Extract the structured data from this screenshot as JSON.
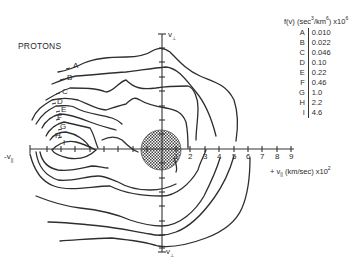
{
  "figure": {
    "title": "PROTONS",
    "legend": {
      "title_prefix": "f(v) (sec",
      "title_exp1": "3",
      "title_mid": "/km",
      "title_exp2": "6",
      "title_suffix": ") x10",
      "title_exp3": "6",
      "entries": [
        {
          "key": "A",
          "value": "0.010"
        },
        {
          "key": "B",
          "value": "0.022"
        },
        {
          "key": "C",
          "value": "0.046"
        },
        {
          "key": "D",
          "value": "0.10"
        },
        {
          "key": "E",
          "value": "0.22"
        },
        {
          "key": "F",
          "value": "0.46"
        },
        {
          "key": "G",
          "value": "1.0"
        },
        {
          "key": "H",
          "value": "2.2"
        },
        {
          "key": "I",
          "value": "4.6"
        }
      ]
    },
    "axes": {
      "x_positive_label": "+ v",
      "x_positive_sub": "||",
      "x_units": " (km/sec) x10",
      "x_units_exp": "2",
      "x_negative_label": "-v",
      "x_negative_sub": "||",
      "y_top_label": "v",
      "y_top_sub": "⊥",
      "y_bottom_label": "v",
      "y_bottom_sub": "⊥",
      "x_ticks": [
        "1",
        "2",
        "3",
        "4",
        "5",
        "6",
        "7",
        "8",
        "9"
      ]
    },
    "contour_labels": [
      "A",
      "B",
      "C",
      "D",
      "E",
      "F",
      "G",
      "H",
      "I"
    ]
  }
}
